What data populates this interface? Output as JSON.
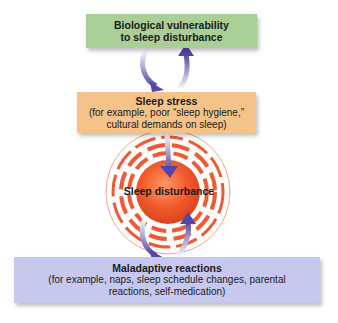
{
  "diagram": {
    "nodes": [
      {
        "id": "bio",
        "title": "Biological vulnerability",
        "title2": "to sleep disturbance",
        "color": "#a9cf97"
      },
      {
        "id": "stress",
        "title": "Sleep stress",
        "line1": "(for example, poor “sleep hygiene,”",
        "line2": "cultural demands on sleep)",
        "color": "#f5c38a"
      },
      {
        "id": "disturbance",
        "title": "Sleep disturbance",
        "color": "#f0562e"
      },
      {
        "id": "maladaptive",
        "title": "Maladaptive reactions",
        "line1": "(for example, naps, sleep schedule changes, parental",
        "line2": "reactions, self-medication)",
        "color": "#c7c8ef"
      }
    ],
    "arrows": [
      {
        "from": "bio",
        "to": "stress"
      },
      {
        "from": "stress",
        "to": "bio"
      },
      {
        "from": "stress",
        "to": "disturbance"
      },
      {
        "from": "disturbance",
        "to": "maladaptive"
      },
      {
        "from": "maladaptive",
        "to": "disturbance"
      }
    ],
    "arrow_color": "#5b4fa8"
  }
}
